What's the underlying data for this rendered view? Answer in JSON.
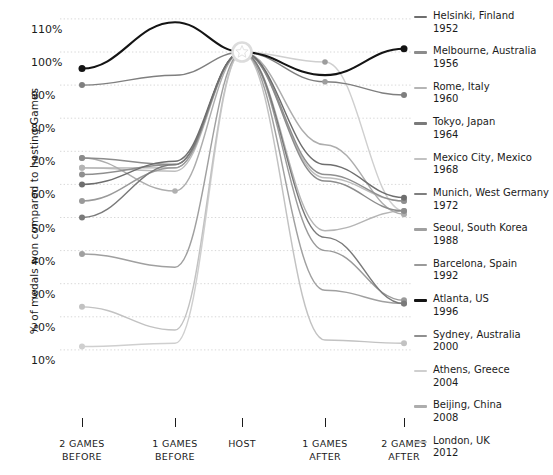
{
  "chart_data": {
    "type": "line",
    "title": "",
    "subtitle": "",
    "xlabel": "",
    "ylabel": "% of medals won compared to hosting Games",
    "categories": [
      "2 GAMES BEFORE",
      "1 GAMES BEFORE",
      "HOST",
      "1 GAMES AFTER",
      "2 GAMES AFTER"
    ],
    "category_lines": [
      [
        "2 GAMES",
        "BEFORE"
      ],
      [
        "1 GAMES",
        "BEFORE"
      ],
      [
        "HOST",
        ""
      ],
      [
        "1 GAMES",
        "AFTER"
      ],
      [
        "2 GAMES",
        "AFTER"
      ]
    ],
    "yticks": [
      110,
      100,
      90,
      80,
      70,
      60,
      50,
      40,
      30,
      20,
      10
    ],
    "ytick_labels": [
      "110%",
      "100%",
      "90%",
      "80%",
      "70%",
      "60%",
      "50%",
      "40%",
      "30%",
      "20%",
      "10%"
    ],
    "ylim": [
      5,
      114
    ],
    "grid": true,
    "grid_style": "dotted",
    "legend_position": "right",
    "host_value": 100,
    "host_marker": "star",
    "series": [
      {
        "name": "Helsinki, Finland",
        "year": "1952",
        "color": "#6e6e6e",
        "values": [
          60,
          67,
          100,
          66,
          56
        ]
      },
      {
        "name": "Melbourne, Australia",
        "year": "1956",
        "color": "#8c8c8c",
        "values": [
          68,
          66,
          100,
          61,
          52
        ]
      },
      {
        "name": "Rome, Italy",
        "year": "1960",
        "color": "#b5b5b5",
        "values": [
          65,
          65,
          100,
          46,
          52
        ]
      },
      {
        "name": "Tokyo, Japan",
        "year": "1964",
        "color": "#7a7a7a",
        "values": [
          50,
          66,
          100,
          44,
          24
        ]
      },
      {
        "name": "Mexico City, Mexico",
        "year": "1968",
        "color": "#c2c2c2",
        "values": [
          23,
          16,
          100,
          13,
          12
        ]
      },
      {
        "name": "Munich, West Germany",
        "year": "1972",
        "color": "#7f7f7f",
        "values": [
          90,
          93,
          100,
          91,
          87
        ]
      },
      {
        "name": "Seoul, South Korea",
        "year": "1988",
        "color": "#a0a0a0",
        "values": [
          39,
          35,
          100,
          28,
          24
        ]
      },
      {
        "name": "Barcelona, Spain",
        "year": "1992",
        "color": "#9a9a9a",
        "values": [
          55,
          65,
          100,
          40,
          25
        ]
      },
      {
        "name": "Atlanta, US",
        "year": "1996",
        "color": "#141414",
        "values": [
          95,
          109,
          100,
          93,
          101
        ]
      },
      {
        "name": "Sydney, Australia",
        "year": "2000",
        "color": "#8f8f8f",
        "values": [
          63,
          66,
          100,
          63,
          55
        ]
      },
      {
        "name": "Athens, Greece",
        "year": "2004",
        "color": "#cfcfcf",
        "values": [
          11,
          12,
          100,
          97,
          52
        ]
      },
      {
        "name": "Beijing, China",
        "year": "2008",
        "color": "#adadad",
        "values": [
          68,
          58,
          100,
          72,
          51
        ]
      },
      {
        "name": "London, UK",
        "year": "2012",
        "color": "#bdbdbd",
        "values": [
          65,
          64,
          100,
          62,
          55
        ]
      }
    ],
    "markers": {
      "2 GAMES BEFORE": [
        95,
        90,
        68,
        65,
        63,
        60,
        55,
        50,
        39,
        23,
        11
      ],
      "1 GAMES BEFORE": [
        58
      ],
      "1 GAMES AFTER": [
        97,
        91
      ],
      "2 GAMES AFTER": [
        101,
        89,
        87,
        56,
        52,
        24,
        12
      ]
    }
  },
  "legend": {
    "items": [
      {
        "label": "Helsinki, Finland",
        "year": "1952"
      },
      {
        "label": "Melbourne, Australia",
        "year": "1956"
      },
      {
        "label": "Rome, Italy",
        "year": "1960"
      },
      {
        "label": "Tokyo, Japan",
        "year": "1964"
      },
      {
        "label": "Mexico City, Mexico",
        "year": "1968"
      },
      {
        "label": "Munich, West Germany",
        "year": "1972"
      },
      {
        "label": "Seoul, South Korea",
        "year": "1988"
      },
      {
        "label": "Barcelona, Spain",
        "year": "1992"
      },
      {
        "label": "Atlanta, US",
        "year": "1996"
      },
      {
        "label": "Sydney, Australia",
        "year": "2000"
      },
      {
        "label": "Athens, Greece",
        "year": "2004"
      },
      {
        "label": "Beijing, China",
        "year": "2008"
      },
      {
        "label": "London, UK",
        "year": "2012"
      }
    ]
  },
  "colors": {
    "background": "#ffffff",
    "text": "#1b1b1b",
    "grid": "#d8d8d8",
    "highlight": "#141414"
  }
}
